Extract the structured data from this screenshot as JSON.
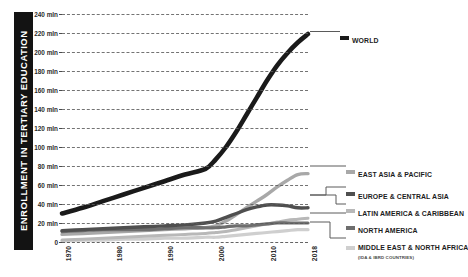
{
  "chart_data": {
    "type": "line",
    "title": "",
    "ylabel": "ENROLLMENT IN TERTIARY EDUCATION",
    "xlabel": "",
    "ylim": [
      0,
      240
    ],
    "xlim": [
      1970,
      2018
    ],
    "grid": true,
    "unit_suffix": "mln",
    "legend_position": "right",
    "y_ticks": [
      0,
      20,
      40,
      60,
      80,
      100,
      120,
      140,
      160,
      180,
      200,
      220,
      240
    ],
    "y_tick_labels": [
      "0",
      "20 mln",
      "40 mln",
      "60 mln",
      "80 mln",
      "100 mln",
      "120 mln",
      "140 mln",
      "160 mln",
      "180 mln",
      "200 mln",
      "220 mln",
      "240 mln"
    ],
    "x_ticks": [
      1970,
      1980,
      1990,
      2000,
      2010,
      2018
    ],
    "x_tick_labels": [
      "1970",
      "1980",
      "1990",
      "2000",
      "2010",
      "2018"
    ],
    "x": [
      1970,
      1974,
      1978,
      1982,
      1986,
      1990,
      1994,
      1998,
      2000,
      2002,
      2004,
      2006,
      2008,
      2010,
      2012,
      2014,
      2016,
      2018
    ],
    "series": [
      {
        "name": "WORLD",
        "color": "#1a1a1a",
        "width": 4.6,
        "values": [
          30,
          36,
          43,
          50,
          57,
          64,
          71,
          77,
          87,
          100,
          116,
          134,
          152,
          170,
          186,
          199,
          210,
          219
        ]
      },
      {
        "name": "EAST ASIA & PACIFIC",
        "color": "#a8a8a8",
        "width": 3.4,
        "values": [
          8,
          9,
          10,
          11,
          12,
          13,
          14,
          15,
          17,
          22,
          29,
          36,
          43,
          50,
          58,
          65,
          71,
          72
        ]
      },
      {
        "name": "EUROPE & CENTRAL ASIA",
        "color": "#4f4f4f",
        "width": 3.4,
        "values": [
          12,
          13,
          14,
          15,
          16,
          17,
          18,
          20,
          22,
          26,
          30,
          34,
          37,
          39,
          39,
          38,
          36,
          36
        ]
      },
      {
        "name": "LATIN AMERICA & CARIBBEAN",
        "color": "#b8b8b8",
        "width": 3.0,
        "values": [
          2,
          3,
          4,
          5,
          6,
          7,
          8,
          9,
          10,
          11,
          13,
          15,
          17,
          19,
          21,
          23,
          24,
          25
        ]
      },
      {
        "name": "NORTH AMERICA",
        "color": "#6e6e6e",
        "width": 3.2,
        "values": [
          11,
          12,
          13,
          13,
          13,
          14,
          15,
          15,
          15,
          16,
          17,
          17,
          18,
          19,
          20,
          20,
          20,
          20
        ]
      },
      {
        "name": "MIDDLE EAST & NORTH AFRICA",
        "sublabel": "(IDA & IBRD COUNTRIES)",
        "color": "#cfcfcf",
        "width": 3.2,
        "values": [
          1,
          2,
          2,
          3,
          3,
          4,
          4,
          5,
          5,
          6,
          7,
          8,
          9,
          10,
          11,
          12,
          13,
          13
        ]
      }
    ]
  },
  "legend": {
    "world": {
      "label": "WORLD",
      "swatch": "#1a1a1a"
    },
    "items": [
      {
        "label": "EAST ASIA & PACIFIC",
        "sublabel": "",
        "swatch": "#a8a8a8"
      },
      {
        "label": "EUROPE & CENTRAL ASIA",
        "sublabel": "",
        "swatch": "#4f4f4f"
      },
      {
        "label": "LATIN AMERICA & CARIBBEAN",
        "sublabel": "",
        "swatch": "#b8b8b8"
      },
      {
        "label": "NORTH AMERICA",
        "sublabel": "",
        "swatch": "#6e6e6e"
      },
      {
        "label": "MIDDLE EAST & NORTH AFRICA",
        "sublabel": "(IDA & IBRD COUNTRIES)",
        "swatch": "#cfcfcf"
      }
    ]
  },
  "axis": {
    "y_title": "ENROLLMENT IN TERTIARY EDUCATION",
    "y_title_bg": "#131313",
    "y_title_color": "#ffffff"
  }
}
